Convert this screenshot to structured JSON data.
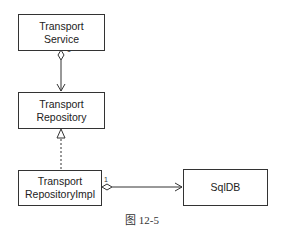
{
  "diagram": {
    "nodes": [
      {
        "id": "transport-service",
        "line1": "Transport",
        "line2": "Service"
      },
      {
        "id": "transport-repository",
        "line1": "Transport",
        "line2": "Repository"
      },
      {
        "id": "transport-repository-impl",
        "line1": "Transport",
        "line2": "RepositoryImpl"
      },
      {
        "id": "sqldb",
        "line1": "SqlDB"
      }
    ],
    "edges": [
      {
        "from": "transport-service",
        "to": "transport-repository",
        "type": "aggregation",
        "multiplicity": "1"
      },
      {
        "from": "transport-repository-impl",
        "to": "transport-repository",
        "type": "realization"
      },
      {
        "from": "transport-repository-impl",
        "to": "sqldb",
        "type": "aggregation",
        "multiplicity": "1"
      }
    ],
    "caption": "图 12-5"
  }
}
